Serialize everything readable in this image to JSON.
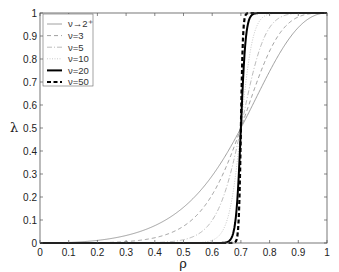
{
  "chart_data": {
    "type": "line",
    "title": "",
    "xlabel": "ρ",
    "ylabel": "λ",
    "xlim": [
      0,
      1
    ],
    "ylim": [
      0,
      1
    ],
    "grid": false,
    "legend_position": "upper-left",
    "x_ticks": [
      "0",
      "0.1",
      "0.2",
      "0.3",
      "0.4",
      "0.5",
      "0.6",
      "0.7",
      "0.8",
      "0.9",
      "1"
    ],
    "y_ticks": [
      "0",
      "0.1",
      "0.2",
      "0.3",
      "0.4",
      "0.5",
      "0.6",
      "0.7",
      "0.8",
      "0.9",
      "1"
    ],
    "crossing_point": {
      "x": 0.7,
      "y": 0.5
    },
    "series": [
      {
        "name": "ν→2⁺",
        "style": "thin-solid",
        "color": "#888888",
        "steepness": 2,
        "x": [
          0,
          0.1,
          0.2,
          0.3,
          0.4,
          0.5,
          0.6,
          0.7,
          0.8,
          0.9,
          1
        ],
        "y": [
          0,
          0.002,
          0.04,
          0.07,
          0.15,
          0.27,
          0.39,
          0.5,
          0.62,
          0.8,
          1
        ]
      },
      {
        "name": "ν=3",
        "style": "thin-dashed",
        "color": "#888888",
        "steepness": 3,
        "x": [
          0,
          0.1,
          0.2,
          0.3,
          0.4,
          0.5,
          0.6,
          0.7,
          0.8,
          0.9,
          1
        ],
        "y": [
          0,
          0.0,
          0.01,
          0.03,
          0.08,
          0.16,
          0.32,
          0.5,
          0.74,
          0.93,
          1
        ]
      },
      {
        "name": "ν=5",
        "style": "thin-dashdot",
        "color": "#aaaaaa",
        "steepness": 5,
        "x": [
          0,
          0.1,
          0.2,
          0.3,
          0.4,
          0.5,
          0.6,
          0.7,
          0.8,
          0.9,
          1
        ],
        "y": [
          0,
          0,
          0,
          0.01,
          0.03,
          0.08,
          0.23,
          0.5,
          0.83,
          0.98,
          1
        ]
      },
      {
        "name": "ν=10",
        "style": "thin-dotted",
        "color": "#bbbbbb",
        "steepness": 10,
        "x": [
          0,
          0.1,
          0.2,
          0.3,
          0.4,
          0.5,
          0.6,
          0.7,
          0.8,
          0.9,
          1
        ],
        "y": [
          0,
          0,
          0,
          0,
          0,
          0.01,
          0.1,
          0.5,
          0.96,
          1,
          1
        ]
      },
      {
        "name": "ν=20",
        "style": "thick-solid",
        "color": "#000000",
        "steepness": 25,
        "x": [
          0,
          0.1,
          0.2,
          0.3,
          0.4,
          0.5,
          0.6,
          0.65,
          0.7,
          0.75,
          0.8,
          1
        ],
        "y": [
          0,
          0,
          0,
          0,
          0,
          0,
          0.01,
          0.1,
          0.5,
          0.97,
          1,
          1
        ]
      },
      {
        "name": "ν=50",
        "style": "thick-dashed",
        "color": "#000000",
        "steepness": 60,
        "x": [
          0,
          0.1,
          0.2,
          0.3,
          0.4,
          0.5,
          0.6,
          0.68,
          0.7,
          0.72,
          0.8,
          1
        ],
        "y": [
          0,
          0,
          0,
          0,
          0,
          0,
          0,
          0.05,
          0.5,
          0.95,
          1,
          1
        ]
      }
    ]
  }
}
